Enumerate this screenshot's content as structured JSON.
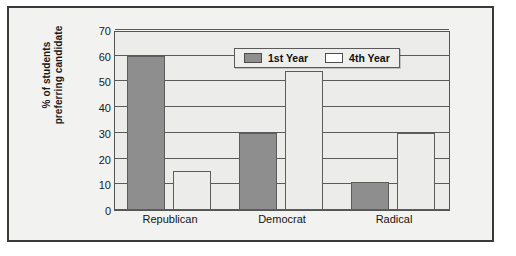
{
  "chart_data": {
    "type": "bar",
    "title": "",
    "xlabel": "",
    "ylabel": "% of students preferring candidate",
    "ylabel_lines": [
      "% of students",
      "preferring candidate"
    ],
    "categories": [
      "Republican",
      "Democrat",
      "Radical"
    ],
    "series": [
      {
        "name": "1st Year",
        "values": [
          60,
          30,
          11
        ],
        "color": "#8e8e8e"
      },
      {
        "name": "4th Year",
        "values": [
          15,
          54,
          30
        ],
        "color": "#ffffff"
      }
    ],
    "yticks": [
      0,
      10,
      20,
      30,
      40,
      50,
      60,
      70
    ],
    "ylim": [
      0,
      70
    ],
    "grid": true,
    "legend_position": "top-center"
  },
  "legend": {
    "items": [
      {
        "label": "1st Year",
        "swatch": "dark-gray-swatch"
      },
      {
        "label": "4th Year",
        "swatch": "white-swatch"
      }
    ]
  },
  "colors": {
    "frame_border": "#3a3a3a",
    "plot_background": "#ececeb",
    "figure_background": "#f2f2f0",
    "gridline": "#5a5a5a",
    "bar_first_year": "#8e8e8e",
    "bar_fourth_year": "#ececea"
  }
}
